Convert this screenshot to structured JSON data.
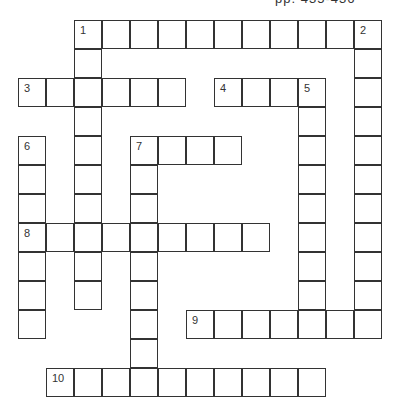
{
  "header": {
    "text": "pp. 435-436"
  },
  "puzzle": {
    "cell_size": [
      28,
      29
    ],
    "origin": [
      18,
      20
    ],
    "entries": [
      {
        "number": "1",
        "direction": "across",
        "row": 0,
        "col": 2,
        "length": 11
      },
      {
        "number": "1",
        "direction": "down",
        "row": 0,
        "col": 2,
        "length": 10
      },
      {
        "number": "2",
        "direction": "down",
        "row": 0,
        "col": 12,
        "length": 11
      },
      {
        "number": "3",
        "direction": "across",
        "row": 2,
        "col": 0,
        "length": 6
      },
      {
        "number": "4",
        "direction": "across",
        "row": 2,
        "col": 7,
        "length": 4
      },
      {
        "number": "5",
        "direction": "down",
        "row": 2,
        "col": 10,
        "length": 9
      },
      {
        "number": "6",
        "direction": "down",
        "row": 4,
        "col": 0,
        "length": 7
      },
      {
        "number": "7",
        "direction": "across",
        "row": 4,
        "col": 4,
        "length": 4
      },
      {
        "number": "7",
        "direction": "down",
        "row": 4,
        "col": 4,
        "length": 9
      },
      {
        "number": "8",
        "direction": "across",
        "row": 7,
        "col": 0,
        "length": 9
      },
      {
        "number": "9",
        "direction": "across",
        "row": 10,
        "col": 6,
        "length": 7
      },
      {
        "number": "10",
        "direction": "across",
        "row": 12,
        "col": 1,
        "length": 10
      }
    ]
  }
}
